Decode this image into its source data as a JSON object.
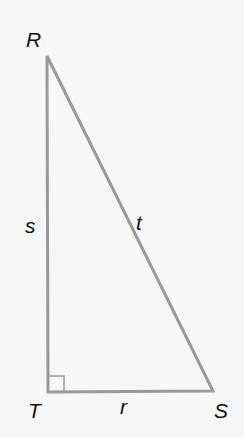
{
  "diagram": {
    "type": "right-triangle",
    "vertices": [
      {
        "label": "R",
        "x": 47,
        "y": 56
      },
      {
        "label": "T",
        "x": 48,
        "y": 392
      },
      {
        "label": "S",
        "x": 213,
        "y": 391
      }
    ],
    "sides": [
      {
        "label": "s",
        "from": "R",
        "to": "T"
      },
      {
        "label": "t",
        "from": "R",
        "to": "S"
      },
      {
        "label": "r",
        "from": "T",
        "to": "S"
      }
    ],
    "right_angle_at": "T",
    "line_color": "#999999"
  }
}
